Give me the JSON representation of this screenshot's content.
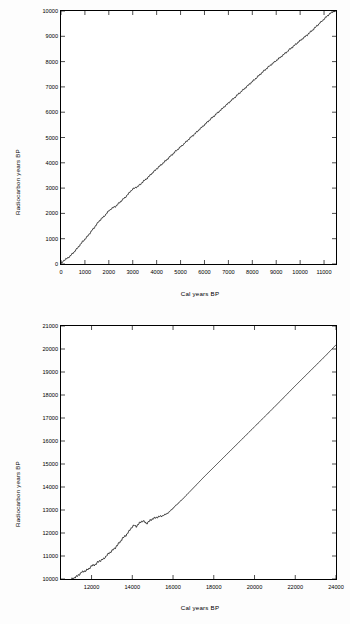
{
  "figure": {
    "background": "#fdfdfd",
    "ink": "#000000"
  },
  "panels": [
    {
      "letter": "A",
      "xlabel": "Cal years BP",
      "ylabel": "Radiocarbon years BP"
    },
    {
      "letter": "B",
      "xlabel": "Cal years BP",
      "ylabel": "Radiocarbon years BP"
    }
  ],
  "chart_data": [
    {
      "type": "line",
      "title": "",
      "panel": "A",
      "xlabel": "Cal years BP",
      "ylabel": "Radiocarbon years BP",
      "xlim": [
        0,
        11500
      ],
      "ylim": [
        0,
        10000
      ],
      "xticks": [
        0,
        1000,
        2000,
        3000,
        4000,
        5000,
        6000,
        7000,
        8000,
        9000,
        10000,
        11000
      ],
      "yticks": [
        0,
        1000,
        2000,
        3000,
        4000,
        5000,
        6000,
        7000,
        8000,
        9000,
        10000
      ],
      "grid": false,
      "legend": false,
      "series": [
        {
          "name": "IntCal calibration curve",
          "x": [
            0,
            100,
            200,
            300,
            400,
            500,
            600,
            700,
            800,
            900,
            1000,
            1100,
            1200,
            1300,
            1400,
            1500,
            1600,
            1700,
            1800,
            1900,
            2000,
            2100,
            2200,
            2300,
            2400,
            2500,
            2600,
            2700,
            2800,
            2900,
            3000,
            3100,
            3200,
            3300,
            3400,
            3500,
            3600,
            3700,
            3800,
            3900,
            4000,
            4200,
            4400,
            4600,
            4800,
            5000,
            5200,
            5400,
            5600,
            5800,
            6000,
            6200,
            6400,
            6600,
            6800,
            7000,
            7200,
            7400,
            7600,
            7800,
            8000,
            8200,
            8400,
            8600,
            8800,
            9000,
            9200,
            9400,
            9600,
            9800,
            10000,
            10200,
            10400,
            10600,
            10800,
            11000,
            11200,
            11400,
            11500
          ],
          "y": [
            30,
            120,
            190,
            250,
            330,
            430,
            530,
            640,
            760,
            880,
            980,
            1080,
            1210,
            1330,
            1450,
            1580,
            1700,
            1800,
            1880,
            1990,
            2100,
            2180,
            2240,
            2290,
            2380,
            2480,
            2560,
            2650,
            2750,
            2870,
            2960,
            3010,
            3060,
            3130,
            3230,
            3310,
            3390,
            3480,
            3580,
            3670,
            3760,
            3930,
            4100,
            4280,
            4460,
            4630,
            4800,
            4980,
            5150,
            5330,
            5500,
            5680,
            5850,
            6020,
            6190,
            6360,
            6530,
            6700,
            6870,
            7040,
            7210,
            7380,
            7560,
            7730,
            7890,
            8040,
            8190,
            8350,
            8510,
            8670,
            8830,
            8980,
            9140,
            9320,
            9500,
            9680,
            9860,
            9990,
            10000
          ]
        }
      ]
    },
    {
      "type": "line",
      "title": "",
      "panel": "B",
      "xlabel": "Cal years BP",
      "ylabel": "Radiocarbon years BP",
      "xlim": [
        10500,
        24000
      ],
      "ylim": [
        10000,
        21000
      ],
      "xticks": [
        12000,
        14000,
        16000,
        18000,
        20000,
        22000,
        24000
      ],
      "yticks": [
        10000,
        11000,
        12000,
        13000,
        14000,
        15000,
        16000,
        17000,
        18000,
        19000,
        20000,
        21000
      ],
      "grid": false,
      "legend": false,
      "series": [
        {
          "name": "IntCal calibration curve",
          "x": [
            10800,
            11000,
            11100,
            11200,
            11300,
            11400,
            11500,
            11600,
            11700,
            11800,
            11900,
            12000,
            12100,
            12200,
            12300,
            12400,
            12500,
            12600,
            12700,
            12800,
            12900,
            13000,
            13100,
            13200,
            13300,
            13400,
            13500,
            13600,
            13700,
            13800,
            13900,
            14000,
            14100,
            14200,
            14300,
            14400,
            14500,
            14600,
            14700,
            14800,
            14900,
            15000,
            15200,
            15400,
            15600,
            15800,
            16000,
            16500,
            17000,
            17500,
            18000,
            18500,
            19000,
            19500,
            20000,
            20500,
            21000,
            21500,
            22000,
            22500,
            23000,
            23500,
            24000
          ],
          "y": [
            9900,
            9980,
            10030,
            10080,
            10120,
            10200,
            10280,
            10330,
            10350,
            10400,
            10480,
            10560,
            10600,
            10640,
            10720,
            10790,
            10830,
            10880,
            10980,
            11070,
            11150,
            11230,
            11300,
            11400,
            11500,
            11620,
            11740,
            11830,
            11910,
            12020,
            12160,
            12270,
            12330,
            12290,
            12370,
            12480,
            12530,
            12470,
            12420,
            12480,
            12560,
            12620,
            12680,
            12730,
            12790,
            12900,
            13080,
            13500,
            13960,
            14420,
            14860,
            15300,
            15740,
            16180,
            16620,
            17060,
            17500,
            17950,
            18400,
            18840,
            19280,
            19720,
            20180
          ]
        }
      ]
    }
  ]
}
